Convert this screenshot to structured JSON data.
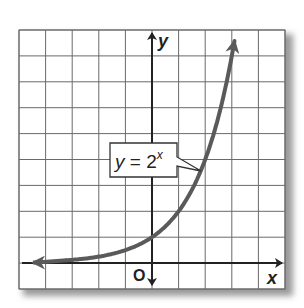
{
  "chart_data": {
    "type": "line",
    "title": "",
    "xlabel": "x",
    "ylabel": "y",
    "origin_label": "O",
    "xlim": [
      -5,
      5
    ],
    "ylim": [
      -1,
      9
    ],
    "grid": true,
    "tick_labels": false,
    "series": [
      {
        "name": "y = 2^x",
        "function": "2^x",
        "x": [
          -5,
          -4,
          -3,
          -2,
          -1,
          0,
          1,
          2,
          3
        ],
        "values": [
          0.03125,
          0.0625,
          0.125,
          0.25,
          0.5,
          1,
          2,
          4,
          8
        ],
        "color": "#555555"
      }
    ],
    "annotations": [
      {
        "text": "y = 2",
        "superscript": "x",
        "points_to": [
          1.8,
          3.5
        ]
      }
    ]
  },
  "colors": {
    "grid": "#6a6a6a",
    "axis": "#222222",
    "curve": "#5a5a5a",
    "shadow": "#bdbdbd"
  }
}
